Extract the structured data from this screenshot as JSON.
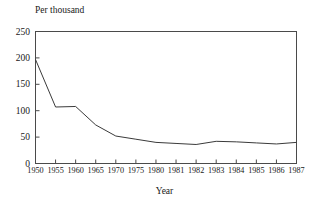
{
  "chart_data": {
    "type": "line",
    "title": "",
    "xlabel": "Year",
    "ylabel": "Per thousand",
    "categories": [
      "1950",
      "1955",
      "1960",
      "1965",
      "1970",
      "1975",
      "1980",
      "1981",
      "1982",
      "1983",
      "1984",
      "1985",
      "1986",
      "1987"
    ],
    "values": [
      197,
      107,
      108,
      73,
      52,
      46,
      40,
      38,
      36,
      42,
      41,
      39,
      37,
      40
    ],
    "series": [
      {
        "name": "Per thousand",
        "values": [
          197,
          107,
          108,
          73,
          52,
          46,
          40,
          38,
          36,
          42,
          41,
          39,
          37,
          40
        ]
      }
    ],
    "ylim": [
      0,
      250
    ],
    "yticks": [
      0,
      50,
      100,
      150,
      200,
      250
    ],
    "ytick_labels": [
      "0",
      "50",
      "100",
      "150",
      "200",
      "250"
    ],
    "xtick_labels": [
      "1950",
      "1955",
      "1960",
      "1965",
      "1970",
      "1975",
      "1980",
      "1981",
      "1982",
      "1983",
      "1984",
      "1985",
      "1986",
      "1987"
    ],
    "grid": false,
    "legend": false,
    "legend_position": "none",
    "line_color": "#3a3a3a",
    "axis_color": "#4a4a4a",
    "background_color": "#ffffff"
  }
}
